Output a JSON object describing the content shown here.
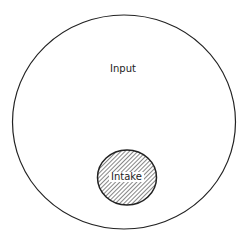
{
  "diagram": {
    "outer": {
      "label": "Input",
      "stroke": "#222222",
      "fill": "#ffffff"
    },
    "inner": {
      "label": "Intake",
      "stroke": "#222222",
      "pattern": "diagonal-hatch"
    }
  }
}
